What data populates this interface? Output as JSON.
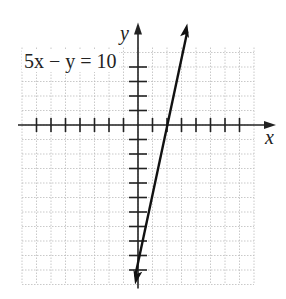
{
  "chart_data": {
    "type": "line",
    "title": "",
    "equation": "5x − y = 10",
    "xlabel": "x",
    "ylabel": "y",
    "xlim": [
      -8,
      8
    ],
    "ylim": [
      -11,
      5
    ],
    "grid": true,
    "series": [
      {
        "name": "5x - y = 10",
        "x": [
          -0.2,
          3.4
        ],
        "y": [
          -11,
          7
        ],
        "slope": 5,
        "intercept": -10,
        "x_intercept": 2,
        "y_intercept": -10
      }
    ]
  },
  "labels": {
    "equation": "5x − y = 10",
    "x_axis": "x",
    "y_axis": "y"
  }
}
